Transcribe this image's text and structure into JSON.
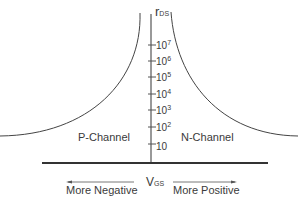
{
  "diagram": {
    "y_axis_label": "r",
    "y_axis_label_sub": "DS",
    "x_axis_label": "V",
    "x_axis_label_sub": "GS",
    "left_region_label": "P-Channel",
    "right_region_label": "N-Channel",
    "left_arrow_label": "More Negative",
    "right_arrow_label": "More Positive",
    "ticks": [
      {
        "base": "10",
        "exp": "7"
      },
      {
        "base": "10",
        "exp": "6"
      },
      {
        "base": "10",
        "exp": "5"
      },
      {
        "base": "10",
        "exp": "4"
      },
      {
        "base": "10",
        "exp": "3"
      },
      {
        "base": "10",
        "exp": "2"
      },
      {
        "base": "10",
        "exp": ""
      }
    ],
    "line_color": "#333333"
  }
}
